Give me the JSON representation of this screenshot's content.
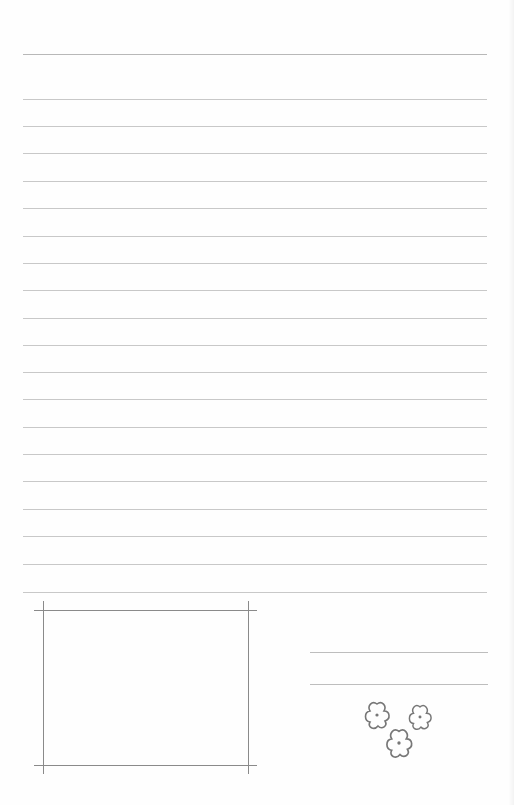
{
  "page": {
    "type": "lined-stationery",
    "background": "#fefefe",
    "rule_color": "#c8c8c8",
    "rule_count": 20,
    "rules_y": [
      54,
      99,
      126,
      153,
      181,
      208,
      236,
      263,
      290,
      318,
      345,
      372,
      399,
      427,
      454,
      481,
      509,
      536,
      564,
      592
    ]
  },
  "photo_frame": {
    "color": "#8a8a8a",
    "top_y": 610,
    "bottom_y": 765,
    "left_x": 43,
    "right_x": 248
  },
  "signature_lines": {
    "y": [
      652,
      684
    ],
    "color": "#bdbdbd"
  },
  "decoration": {
    "icon": "flower-cluster-icon",
    "count": 3,
    "color": "#777777"
  }
}
